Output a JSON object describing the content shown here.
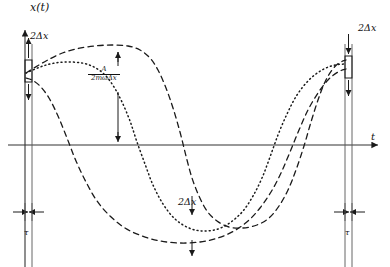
{
  "figure": {
    "axes": {
      "y_label": "x(t)",
      "x_label": "t",
      "y_axis_x_px": 25,
      "x_axis_y_px": 145
    },
    "annotations": {
      "delta_x_left": "2Δx",
      "delta_x_right": "2Δx",
      "delta_x_bottom": "2Δx",
      "tau_left": "τ",
      "tau_right": "τ",
      "amplitude_numerator": "A",
      "amplitude_denominator": "2mωΔx"
    },
    "colors": {
      "ink": "#1a1a1a",
      "axis": "#333333",
      "background": "#ffffff"
    }
  },
  "chart_data": {
    "type": "line",
    "title": "",
    "xlabel": "t",
    "ylabel": "x(t)",
    "grid": false,
    "legend": "none",
    "xlim": [
      0,
      390
    ],
    "ylim": [
      267,
      0
    ],
    "series": [
      {
        "name": "trajectory-dashed-upper",
        "style": "dashed",
        "points": [
          [
            26,
            73
          ],
          [
            34,
            68
          ],
          [
            46,
            61
          ],
          [
            60,
            54
          ],
          [
            76,
            49
          ],
          [
            94,
            46
          ],
          [
            112,
            45
          ],
          [
            128,
            46
          ],
          [
            140,
            50
          ],
          [
            150,
            58
          ],
          [
            158,
            70
          ],
          [
            166,
            88
          ],
          [
            173,
            108
          ],
          [
            180,
            132
          ],
          [
            186,
            156
          ],
          [
            192,
            178
          ],
          [
            199,
            196
          ],
          [
            207,
            211
          ],
          [
            217,
            221
          ],
          [
            229,
            227
          ],
          [
            243,
            228
          ],
          [
            257,
            225
          ],
          [
            269,
            218
          ],
          [
            279,
            206
          ],
          [
            288,
            190
          ],
          [
            296,
            170
          ],
          [
            304,
            146
          ],
          [
            311,
            122
          ],
          [
            318,
            100
          ],
          [
            325,
            82
          ],
          [
            332,
            70
          ],
          [
            339,
            63
          ],
          [
            346,
            60
          ]
        ]
      },
      {
        "name": "trajectory-dotted-middle",
        "style": "dotted",
        "points": [
          [
            26,
            73
          ],
          [
            33,
            70
          ],
          [
            43,
            66
          ],
          [
            55,
            63
          ],
          [
            68,
            62
          ],
          [
            82,
            63
          ],
          [
            94,
            67
          ],
          [
            105,
            75
          ],
          [
            114,
            87
          ],
          [
            122,
            102
          ],
          [
            130,
            121
          ],
          [
            137,
            142
          ],
          [
            145,
            164
          ],
          [
            153,
            185
          ],
          [
            163,
            204
          ],
          [
            175,
            219
          ],
          [
            189,
            228
          ],
          [
            203,
            231
          ],
          [
            218,
            229
          ],
          [
            231,
            222
          ],
          [
            243,
            211
          ],
          [
            253,
            196
          ],
          [
            262,
            178
          ],
          [
            270,
            157
          ],
          [
            278,
            135
          ],
          [
            287,
            114
          ],
          [
            297,
            95
          ],
          [
            309,
            80
          ],
          [
            322,
            70
          ],
          [
            335,
            65
          ],
          [
            346,
            64
          ]
        ]
      },
      {
        "name": "trajectory-dashed-lower",
        "style": "dashed",
        "points": [
          [
            26,
            78
          ],
          [
            32,
            80
          ],
          [
            40,
            86
          ],
          [
            49,
            98
          ],
          [
            58,
            116
          ],
          [
            67,
            138
          ],
          [
            76,
            161
          ],
          [
            86,
            182
          ],
          [
            97,
            201
          ],
          [
            110,
            216
          ],
          [
            125,
            228
          ],
          [
            142,
            236
          ],
          [
            160,
            241
          ],
          [
            180,
            243
          ],
          [
            200,
            242
          ],
          [
            218,
            238
          ],
          [
            234,
            231
          ],
          [
            248,
            221
          ],
          [
            260,
            208
          ],
          [
            271,
            192
          ],
          [
            281,
            173
          ],
          [
            290,
            152
          ],
          [
            299,
            130
          ],
          [
            308,
            110
          ],
          [
            318,
            93
          ],
          [
            328,
            80
          ],
          [
            338,
            72
          ],
          [
            346,
            69
          ]
        ]
      }
    ],
    "markers": [
      {
        "name": "amplitude-arrow",
        "type": "double-headed-vertical-arrow",
        "x_px": 118,
        "y_top_px": 47,
        "y_bottom_px": 142,
        "label": "A / (2mωΔx)"
      },
      {
        "name": "delta-x-bracket-left",
        "type": "vertical-bracket",
        "x_px": 28,
        "y_top_px": 58,
        "y_bottom_px": 84,
        "label": "2Δx"
      },
      {
        "name": "delta-x-bracket-right",
        "type": "vertical-bracket",
        "x_px": 348,
        "y_top_px": 54,
        "y_bottom_px": 78,
        "label": "2Δx"
      },
      {
        "name": "delta-x-bracket-bottom",
        "type": "vertical-bracket",
        "x_px": 192,
        "y_top_px": 214,
        "y_bottom_px": 240,
        "label": "2Δx"
      },
      {
        "name": "tau-interval-left",
        "type": "double-headed-horizontal-arrow",
        "x_left_px": 13,
        "x_right_px": 44,
        "y_px": 212,
        "label": "τ"
      },
      {
        "name": "tau-interval-right",
        "type": "double-headed-horizontal-arrow",
        "x_left_px": 334,
        "x_right_px": 365,
        "y_px": 212,
        "label": "τ"
      }
    ]
  }
}
